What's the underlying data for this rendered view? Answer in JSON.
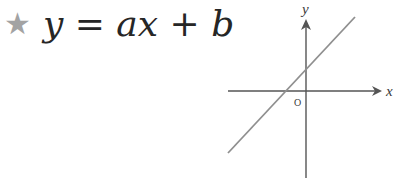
{
  "title": {
    "icon": "star-icon",
    "icon_glyph": "★",
    "icon_color": "#a3a3a3",
    "formula": {
      "lhs": "y",
      "eq": " = ",
      "a": "a",
      "x": "x",
      "plus": " + ",
      "b": "b"
    }
  },
  "graph": {
    "x_axis_label": "x",
    "y_axis_label": "y",
    "origin_label": "O",
    "line_color": "#8f8f8f",
    "axis_color": "#555555",
    "line": {
      "slope_sign": "positive",
      "intercept_sign": "positive"
    }
  }
}
